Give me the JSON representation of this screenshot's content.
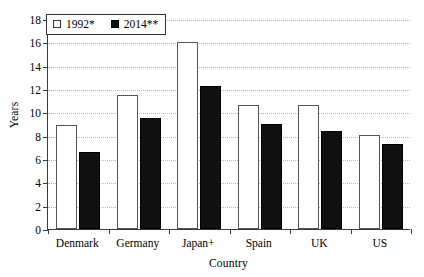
{
  "chart_data": {
    "type": "bar",
    "title": "",
    "subtitle": "",
    "xlabel": "Country",
    "ylabel": "Years",
    "categories": [
      "Denmark",
      "Germany",
      "Japan+",
      "Spain",
      "UK",
      "US"
    ],
    "series": [
      {
        "name": "1992*",
        "style": "open",
        "values": [
          8.9,
          11.5,
          16.0,
          10.6,
          10.6,
          8.1
        ]
      },
      {
        "name": "2014**",
        "style": "filled",
        "values": [
          6.6,
          9.5,
          12.3,
          9.0,
          8.4,
          7.3
        ]
      }
    ],
    "ylim": [
      0,
      18
    ],
    "ytick_step": 2,
    "yticks": [
      0,
      2,
      4,
      6,
      8,
      10,
      12,
      14,
      16,
      18
    ],
    "ytick_labels": [
      "0",
      "2",
      "4",
      "6",
      "8",
      "10",
      "12",
      "14",
      "16",
      "18"
    ],
    "grid": true,
    "grid_axis": "y",
    "grid_style": "dotted",
    "legend_position": "top-left",
    "colors": {
      "series_1992": "#ffffff",
      "series_2014": "#111111",
      "axis": "#3a3a3a",
      "grid": "#b9b9b9",
      "background": "#ffffff",
      "text": "#000000"
    }
  },
  "legend": {
    "entries": [
      {
        "label": "1992*",
        "swatch": "open-square-icon"
      },
      {
        "label": "2014**",
        "swatch": "filled-square-icon"
      }
    ]
  }
}
